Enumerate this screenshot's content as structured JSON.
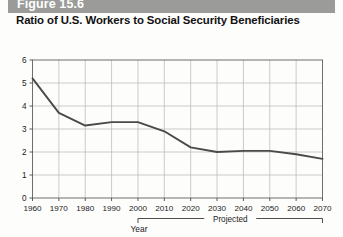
{
  "figure": {
    "bar_label": "Figure 15.6",
    "title": "Ratio of U.S. Workers to Social Security Beneficiaries",
    "bar_color": "#9b9b99"
  },
  "chart_data": {
    "type": "line",
    "title": "Ratio of U.S. Workers to Social Security Beneficiaries",
    "xlabel": "Year",
    "ylabel": "",
    "xlim": [
      1960,
      2070
    ],
    "ylim": [
      0,
      6
    ],
    "grid": true,
    "legend": "none",
    "line_color": "#4a4a4a",
    "categories": [
      1960,
      1970,
      1980,
      1990,
      2000,
      2010,
      2020,
      2030,
      2040,
      2050,
      2060,
      2070
    ],
    "values": [
      5.2,
      3.7,
      3.15,
      3.3,
      3.3,
      2.9,
      2.2,
      2.0,
      2.05,
      2.05,
      1.9,
      1.7
    ],
    "x_tick_labels": [
      "1960",
      "1970",
      "1980",
      "1990",
      "2000",
      "2010",
      "2020",
      "2030",
      "2040",
      "2050",
      "2060",
      "2070"
    ],
    "y_tick_labels": [
      "0",
      "1",
      "2",
      "3",
      "4",
      "5",
      "6"
    ],
    "y_ticks": [
      0,
      1,
      2,
      3,
      4,
      5,
      6
    ],
    "annotations": [
      {
        "name": "projected-bracket",
        "label": "Projected",
        "from": 2000,
        "to": 2070
      }
    ]
  }
}
